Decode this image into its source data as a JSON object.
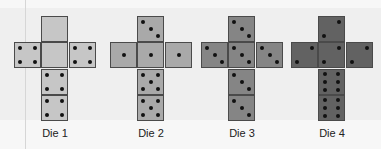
{
  "dice": [
    {
      "label": "Die 1",
      "color": "#c6c6c6",
      "faces": {
        "top": 0,
        "left": 4,
        "center": 0,
        "right": 4,
        "below1": 4,
        "below2": 4
      }
    },
    {
      "label": "Die 2",
      "color": "#a9a9a9",
      "faces": {
        "top": 3,
        "left": 1,
        "center": 1,
        "right": 1,
        "below1": 5,
        "below2": 5
      }
    },
    {
      "label": "Die 3",
      "color": "#858585",
      "faces": {
        "top": 3,
        "left": 3,
        "center": 3,
        "right": 3,
        "below1": 3,
        "below2": 3
      }
    },
    {
      "label": "Die 4",
      "color": "#626262",
      "faces": {
        "top": 2,
        "left": 2,
        "center": 2,
        "right": 2,
        "below1": 6,
        "below2": 6
      }
    }
  ]
}
